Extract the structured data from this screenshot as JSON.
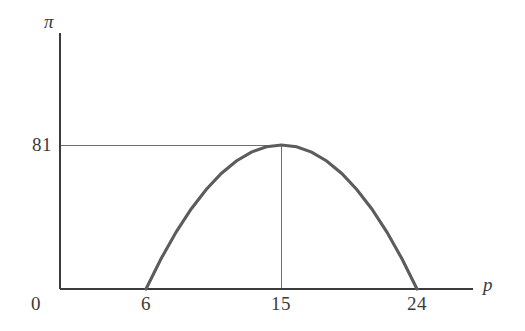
{
  "chart_data": {
    "type": "line",
    "title": "",
    "subtitle": "",
    "xlabel": "p",
    "ylabel": "π",
    "xlim": [
      0,
      28.8
    ],
    "ylim": [
      0,
      136
    ],
    "grid": false,
    "legend": null,
    "x_tick_labels": [
      "0",
      "6",
      "15",
      "24"
    ],
    "x_ticks": [
      0,
      6,
      15,
      24
    ],
    "y_tick_labels": [
      "81"
    ],
    "y_ticks": [
      81
    ],
    "series": [
      {
        "name": "profit curve",
        "equation": "π = -(p - 6)(p - 24) = -(p - 15)^2 + 81",
        "x": [
          6,
          7,
          8,
          9,
          10,
          11,
          12,
          13,
          14,
          15,
          16,
          17,
          18,
          19,
          20,
          21,
          22,
          23,
          24
        ],
        "values": [
          0,
          17,
          32,
          45,
          56,
          65,
          72,
          77,
          80,
          81,
          80,
          77,
          72,
          65,
          56,
          45,
          32,
          17,
          0
        ]
      }
    ],
    "annotations": [
      {
        "name": "vertex-guide-horizontal",
        "kind": "reference-line",
        "orientation": "horizontal",
        "value": 81,
        "from_x": 0,
        "to_x": 15
      },
      {
        "name": "vertex-guide-vertical",
        "kind": "reference-line",
        "orientation": "vertical",
        "value": 15,
        "from_y": 0,
        "to_y": 81
      }
    ],
    "roots": [
      6,
      24
    ],
    "vertex": {
      "p": 15,
      "pi": 81
    }
  },
  "axes": {
    "y_axis_title": "π",
    "x_axis_title": "p",
    "y_tick_81": "81",
    "x_tick_0": "0",
    "x_tick_6": "6",
    "x_tick_15": "15",
    "x_tick_24": "24"
  },
  "colors": {
    "background": "#ffffff",
    "axis": "#3b3b3b",
    "curve": "#5c5c5c",
    "guide_line": "#6e6e6e",
    "label": "#3b3b3b"
  }
}
